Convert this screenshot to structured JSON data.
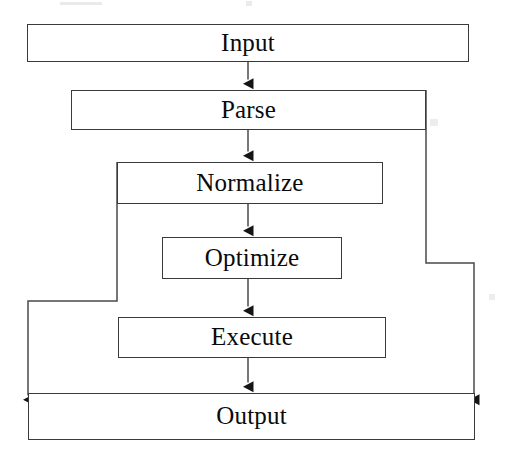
{
  "diagram": {
    "type": "flowchart",
    "orientation": "top-to-bottom",
    "style": {
      "stroke": "#3a3a3a",
      "text_color": "#0a0a0a",
      "background": "#ffffff",
      "arrowhead": "filled-triangle"
    },
    "nodes": [
      {
        "id": "input",
        "label": "Input",
        "shape": "rectangle",
        "x": 27,
        "y": 24,
        "w": 442,
        "h": 38
      },
      {
        "id": "parse",
        "label": "Parse",
        "shape": "rectangle",
        "x": 71,
        "y": 90,
        "w": 355,
        "h": 40
      },
      {
        "id": "normalize",
        "label": "Normalize",
        "shape": "rectangle",
        "x": 117,
        "y": 162,
        "w": 266,
        "h": 42
      },
      {
        "id": "optimize",
        "label": "Optimize",
        "shape": "rectangle",
        "x": 162,
        "y": 237,
        "w": 180,
        "h": 42
      },
      {
        "id": "execute",
        "label": "Execute",
        "shape": "rectangle",
        "x": 118,
        "y": 317,
        "w": 268,
        "h": 41
      },
      {
        "id": "output",
        "label": "Output",
        "shape": "rectangle",
        "x": 28,
        "y": 393,
        "w": 447,
        "h": 47
      }
    ],
    "edges": [
      {
        "id": "input-to-parse",
        "from": "input",
        "to": "parse",
        "kind": "straight",
        "arrow": true
      },
      {
        "id": "parse-to-normalize",
        "from": "parse",
        "to": "normalize",
        "kind": "straight",
        "arrow": true
      },
      {
        "id": "normalize-to-optimize",
        "from": "normalize",
        "to": "optimize",
        "kind": "straight",
        "arrow": true
      },
      {
        "id": "optimize-to-execute",
        "from": "optimize",
        "to": "execute",
        "kind": "straight",
        "arrow": true
      },
      {
        "id": "execute-to-output",
        "from": "execute",
        "to": "output",
        "kind": "straight",
        "arrow": true
      },
      {
        "id": "parse-bypass-output",
        "from": "parse",
        "to": "output",
        "kind": "orthogonal-right",
        "arrow": true
      },
      {
        "id": "normalize-bypass-output",
        "from": "normalize",
        "to": "output",
        "kind": "orthogonal-left",
        "arrow": true
      }
    ]
  }
}
